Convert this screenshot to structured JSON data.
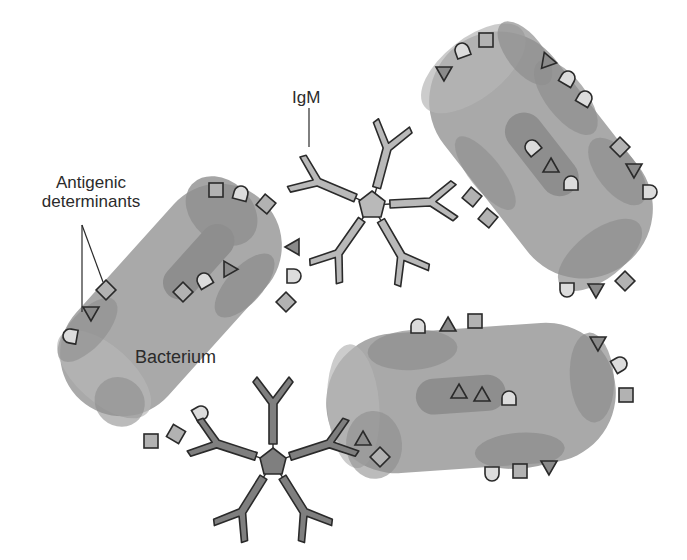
{
  "labels": {
    "antigenic_line1": "Antigenic",
    "antigenic_line2": "determinants",
    "igm": "IgM",
    "bacterium": "Bacterium"
  },
  "colors": {
    "background": "#ffffff",
    "cell_body": "#a9a9a9",
    "cell_dark_patch": "#8e8e8e",
    "cell_highlight": "#bdbdbd",
    "antibody_light": "#b9b9b9",
    "antibody_dark": "#7f7f7f",
    "square_fill": "#b2b2b2",
    "triangle_fill": "#8a8a8a",
    "dome_fill": "#dcdcdc",
    "outline": "#2a2a2a"
  },
  "elements": {
    "bacteria": [
      {
        "id": "bacterium-left",
        "center": [
          171,
          300
        ],
        "rotation_deg": -48,
        "labeled": true
      },
      {
        "id": "bacterium-top-right",
        "center": [
          541,
          155
        ],
        "rotation_deg": 50,
        "labeled": false
      },
      {
        "id": "bacterium-bottom-right",
        "center": [
          471,
          398
        ],
        "rotation_deg": -4,
        "labeled": false
      }
    ],
    "antibodies": [
      {
        "id": "igm-top",
        "type": "IgM pentamer",
        "center": [
          372,
          205
        ],
        "shade": "light"
      },
      {
        "id": "igm-bottom",
        "type": "IgM pentamer",
        "center": [
          273,
          462
        ],
        "shade": "dark"
      }
    ],
    "antigen_shapes": [
      "square",
      "triangle",
      "dome"
    ]
  }
}
